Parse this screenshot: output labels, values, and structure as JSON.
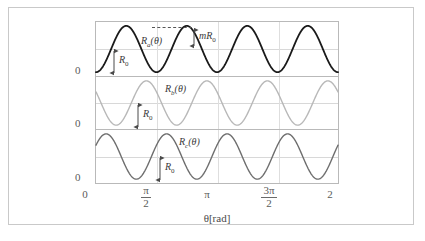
{
  "figure": {
    "x_axis_caption": "θ[rad]",
    "background_color": "#ffffff",
    "frame_color": "#c9c9c9"
  },
  "y_axis": {
    "zero_labels": [
      "0",
      "0",
      "0"
    ]
  },
  "x_ticks": [
    {
      "label": "0",
      "type": "plain",
      "value": 0
    },
    {
      "label": "π/2",
      "type": "fraction",
      "numerator": "π",
      "denominator": "2",
      "value": 1.5707963
    },
    {
      "label": "π",
      "type": "plain",
      "value": 3.1415927
    },
    {
      "label": "3π/2",
      "type": "fraction",
      "numerator": "3π",
      "denominator": "2",
      "value": 4.712389
    },
    {
      "label": "2",
      "type": "plain",
      "value": 6.2831853
    }
  ],
  "annotations": {
    "r0_top": {
      "text": "R",
      "sub": "0"
    },
    "r0_mid": {
      "text": "R",
      "sub": "0"
    },
    "r0_bot": {
      "text": "R",
      "sub": "0"
    },
    "mr0": {
      "text": "mR",
      "sub": "0"
    }
  },
  "chart_data": {
    "type": "line",
    "title": "",
    "xlabel": "θ[rad]",
    "ylabel": "",
    "xlim": [
      0,
      6.2831853
    ],
    "ylim": [
      0,
      2
    ],
    "grid": true,
    "legend_position": "inline",
    "panels": [
      {
        "name": "panel-a",
        "label": "R_a(θ)",
        "label_main": "R",
        "label_sub": "a",
        "label_tail": "(θ)",
        "color": "#1a1a1a",
        "mean": 1.0,
        "amplitude": 0.85,
        "cycles": 4,
        "phase_deg": 180,
        "annotation": [
          "R0",
          "mR0"
        ]
      },
      {
        "name": "panel-b",
        "label": "R_b(θ)",
        "label_main": "R",
        "label_sub": "b",
        "label_tail": "(θ)",
        "color": "#b8b8b8",
        "mean": 1.0,
        "amplitude": 0.85,
        "cycles": 4,
        "phase_deg": 60,
        "annotation": [
          "R0"
        ]
      },
      {
        "name": "panel-c",
        "label": "R_c(θ)",
        "label_main": "R",
        "label_sub": "c",
        "label_tail": "(θ)",
        "color": "#6e6e6e",
        "mean": 1.0,
        "amplitude": 0.85,
        "cycles": 4,
        "phase_deg": 300,
        "annotation": [
          "R0"
        ]
      }
    ],
    "series": [
      {
        "name": "R_a(θ)",
        "formula": "R0 + mR0*cos(4θ + 180°)",
        "mean": 1.0,
        "amplitude": 0.85
      },
      {
        "name": "R_b(θ)",
        "formula": "R0 + mR0*cos(4θ + 60°)",
        "mean": 1.0,
        "amplitude": 0.85
      },
      {
        "name": "R_c(θ)",
        "formula": "R0 + mR0*cos(4θ + 300°)",
        "mean": 1.0,
        "amplitude": 0.85
      }
    ]
  }
}
